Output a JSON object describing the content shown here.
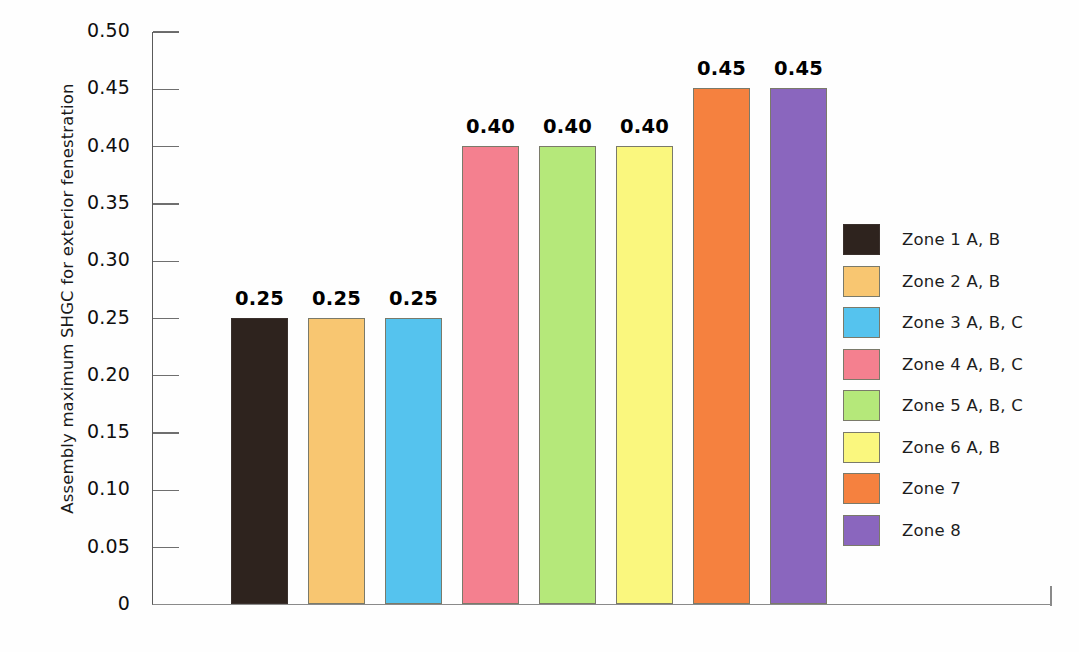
{
  "chart_data": {
    "type": "bar",
    "title": "",
    "xlabel": "",
    "ylabel": "Assembly maximum SHGC for exterior fenestration",
    "ylim": [
      0,
      0.5
    ],
    "ytick_labels": [
      "0.50",
      "0.45",
      "0.40",
      "0.35",
      "0.30",
      "0.25",
      "0.20",
      "0.15",
      "0.10",
      "0.05",
      "0"
    ],
    "ytick_values": [
      0.5,
      0.45,
      0.4,
      0.35,
      0.3,
      0.25,
      0.2,
      0.15,
      0.1,
      0.05,
      0
    ],
    "grid": false,
    "legend_position": "right-center",
    "categories": [
      "Zone 1 A, B",
      "Zone 2 A, B",
      "Zone 3 A, B, C",
      "Zone 4 A, B, C",
      "Zone 5 A, B, C",
      "Zone 6 A, B",
      "Zone 7",
      "Zone 8"
    ],
    "values": [
      0.25,
      0.25,
      0.25,
      0.4,
      0.4,
      0.4,
      0.45,
      0.45
    ],
    "value_labels": [
      "0.25",
      "0.25",
      "0.25",
      "0.40",
      "0.40",
      "0.40",
      "0.45",
      "0.45"
    ],
    "colors": [
      "#2E231E",
      "#F8C671",
      "#55C3EE",
      "#F4808F",
      "#B5E87A",
      "#FAF77E",
      "#F5813F",
      "#8A66BE"
    ],
    "legend": [
      {
        "label": "Zone 1 A, B",
        "color": "#2E231E"
      },
      {
        "label": "Zone 2 A, B",
        "color": "#F8C671"
      },
      {
        "label": "Zone 3 A, B, C",
        "color": "#55C3EE"
      },
      {
        "label": "Zone 4 A, B, C",
        "color": "#F4808F"
      },
      {
        "label": "Zone 5 A, B, C",
        "color": "#B5E87A"
      },
      {
        "label": "Zone 6 A, B",
        "color": "#FAF77E"
      },
      {
        "label": "Zone 7",
        "color": "#F5813F"
      },
      {
        "label": "Zone 8",
        "color": "#8A66BE"
      }
    ]
  }
}
